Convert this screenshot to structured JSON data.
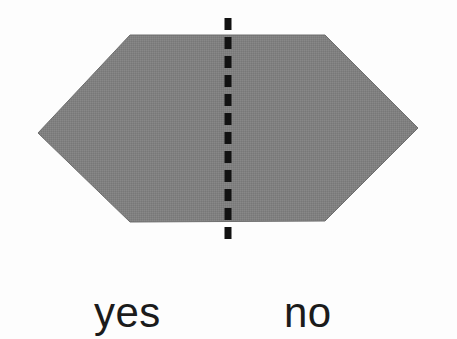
{
  "figure": {
    "background_color": "#fdfdfd",
    "shape": {
      "name": "hexagon",
      "fill_color": "#808080",
      "edge_color": "#6e6e6e",
      "points": "38,133 130,35 325,35 418,128 325,221 130,222",
      "vertices": [
        {
          "x": 38,
          "y": 133,
          "name": "left-vertex"
        },
        {
          "x": 130,
          "y": 35,
          "name": "top-left-vertex"
        },
        {
          "x": 325,
          "y": 35,
          "name": "top-right-vertex"
        },
        {
          "x": 418,
          "y": 128,
          "name": "right-vertex"
        },
        {
          "x": 325,
          "y": 221,
          "name": "bottom-right-vertex"
        },
        {
          "x": 130,
          "y": 222,
          "name": "bottom-left-vertex"
        }
      ]
    },
    "symmetry_line": {
      "name": "vertical-dashed-line",
      "color": "#121212",
      "x": 228,
      "y_start": 18,
      "y_end": 243,
      "stroke_width": 7,
      "dash_length": 12,
      "gap_length": 7
    },
    "labels": {
      "left": "yes",
      "right": "no",
      "text_color": "#1b1b1b",
      "font_size_px": 42
    }
  },
  "chart_data": {
    "type": "diagram",
    "title": "",
    "annotations": [
      {
        "text": "yes",
        "x": 94,
        "y": 331,
        "side": "left"
      },
      {
        "text": "no",
        "x": 284,
        "y": 331,
        "side": "right"
      }
    ]
  }
}
